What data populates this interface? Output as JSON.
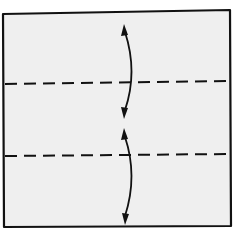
{
  "diagram": {
    "type": "origami-fold-diagram",
    "colors": {
      "background": "#ffffff",
      "paper": "#efefef",
      "stroke": "#111111"
    },
    "paper": {
      "shape": "square",
      "corners": [
        [
          3,
          14
        ],
        [
          230,
          10
        ],
        [
          231,
          226
        ],
        [
          4,
          227
        ]
      ]
    },
    "fold_lines": [
      {
        "kind": "valley",
        "style": "dashed",
        "from": [
          5,
          84
        ],
        "to": [
          229,
          81
        ]
      },
      {
        "kind": "valley",
        "style": "dashed",
        "from": [
          5,
          156
        ],
        "to": [
          229,
          154
        ]
      }
    ],
    "arrows": [
      {
        "kind": "double-headed-curved",
        "from": [
          124,
          25
        ],
        "to": [
          124,
          118
        ],
        "meaning": "fold top edge down to center and unfold"
      },
      {
        "kind": "double-headed-curved",
        "from": [
          124,
          128
        ],
        "to": [
          125,
          224
        ],
        "meaning": "fold bottom edge up to center and unfold"
      }
    ]
  }
}
